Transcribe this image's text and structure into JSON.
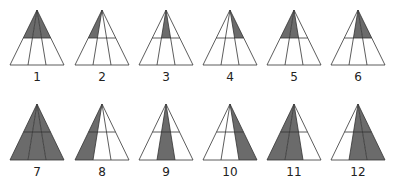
{
  "figure": {
    "colors": {
      "fill": "#6b6b6b",
      "line": "#333333",
      "background": "#ffffff"
    },
    "triangles": [
      {
        "label": "1",
        "shaded": "top-all"
      },
      {
        "label": "2",
        "shaded": "top-left"
      },
      {
        "label": "3",
        "shaded": "top-middle"
      },
      {
        "label": "4",
        "shaded": "top-right"
      },
      {
        "label": "5",
        "shaded": "top-left-middle"
      },
      {
        "label": "6",
        "shaded": "top-middle-right"
      },
      {
        "label": "7",
        "shaded": "full-all"
      },
      {
        "label": "8",
        "shaded": "full-left"
      },
      {
        "label": "9",
        "shaded": "full-middle"
      },
      {
        "label": "10",
        "shaded": "full-right"
      },
      {
        "label": "11",
        "shaded": "full-left-middle"
      },
      {
        "label": "12",
        "shaded": "full-middle-right"
      }
    ]
  }
}
